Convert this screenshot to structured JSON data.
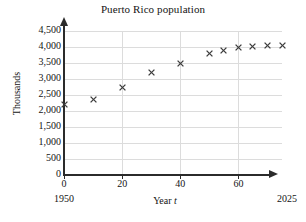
{
  "chart_data": {
    "type": "scatter",
    "title": "Puerto Rico population",
    "xlabel": "Year t",
    "ylabel": "Thousands",
    "xlim": [
      0,
      75
    ],
    "ylim": [
      0,
      4500
    ],
    "grid": true,
    "legend": null,
    "x_tick_labels": [
      "0",
      "20",
      "40",
      "60"
    ],
    "x_ticks": [
      0,
      20,
      40,
      60
    ],
    "y_tick_labels": [
      "0",
      "500",
      "1,000",
      "1,500",
      "2,000",
      "2,500",
      "3,000",
      "3,500",
      "4,000",
      "4,500"
    ],
    "y_ticks": [
      0,
      500,
      1000,
      1500,
      2000,
      2500,
      3000,
      3500,
      4000,
      4500
    ],
    "x_axis_start_annotation": "1950",
    "x_axis_end_annotation": "2025",
    "marker": "x",
    "marker_color": "#3c3c3c",
    "grid_color": "#dcdcdc",
    "axis_color": "#2b2b2b",
    "x": [
      0,
      10,
      20,
      30,
      40,
      50,
      55,
      60,
      65,
      70,
      75
    ],
    "y": [
      2200,
      2350,
      2720,
      3200,
      3500,
      3800,
      3900,
      4000,
      4030,
      4060,
      4050
    ],
    "points": [
      {
        "t": 0,
        "value": 2200
      },
      {
        "t": 10,
        "value": 2350
      },
      {
        "t": 20,
        "value": 2720
      },
      {
        "t": 30,
        "value": 3200
      },
      {
        "t": 40,
        "value": 3500
      },
      {
        "t": 50,
        "value": 3800
      },
      {
        "t": 55,
        "value": 3900
      },
      {
        "t": 60,
        "value": 4000
      },
      {
        "t": 65,
        "value": 4030
      },
      {
        "t": 70,
        "value": 4060
      },
      {
        "t": 75,
        "value": 4050
      }
    ]
  }
}
